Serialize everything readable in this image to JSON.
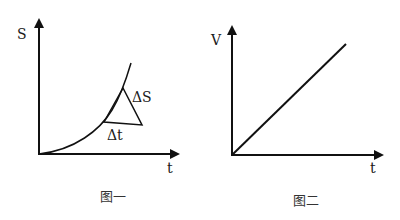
{
  "figures": [
    {
      "caption": "图一",
      "y_label": "S",
      "x_label": "t",
      "curve": "exponential-like increasing curve from origin",
      "annotations": {
        "delta_s": "ΔS",
        "delta_t": "Δt"
      }
    },
    {
      "caption": "图二",
      "y_label": "V",
      "x_label": "t",
      "curve": "straight line through origin"
    }
  ],
  "colors": {
    "stroke": "#111111",
    "background": "#ffffff"
  }
}
